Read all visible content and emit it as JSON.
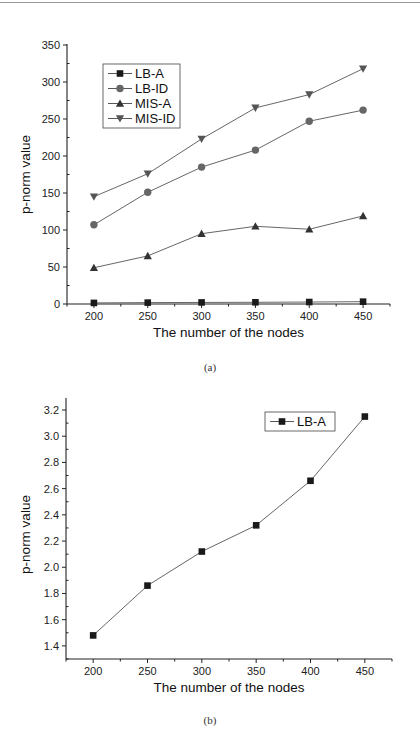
{
  "figure": {
    "captions": [
      "(a)",
      "(b)"
    ]
  },
  "chart_data": [
    {
      "type": "line",
      "panel": "(a)",
      "title": "",
      "xlabel": "The number of the nodes",
      "ylabel": "p-norm value",
      "x": [
        200,
        250,
        300,
        350,
        400,
        450
      ],
      "x_ticks": [
        "200",
        "250",
        "300",
        "350",
        "400",
        "450"
      ],
      "y_ticks": [
        "0",
        "50",
        "100",
        "150",
        "200",
        "250",
        "300",
        "350"
      ],
      "xlim": [
        175,
        475
      ],
      "ylim": [
        0,
        350
      ],
      "grid": false,
      "legend_position": "upper-left",
      "series": [
        {
          "name": "LB-A",
          "marker": "square",
          "color": "#1a1a1a",
          "values": [
            1.48,
            1.86,
            2.12,
            2.32,
            2.66,
            3.15
          ]
        },
        {
          "name": "LB-ID",
          "marker": "circle",
          "color": "#666666",
          "values": [
            107,
            151,
            185,
            208,
            247,
            262
          ]
        },
        {
          "name": "MIS-A",
          "marker": "triangle-up",
          "color": "#333333",
          "values": [
            49,
            65,
            95,
            105,
            101,
            119
          ]
        },
        {
          "name": "MIS-ID",
          "marker": "triangle-down",
          "color": "#555555",
          "values": [
            145,
            176,
            223,
            265,
            283,
            318
          ]
        }
      ]
    },
    {
      "type": "line",
      "panel": "(b)",
      "title": "",
      "xlabel": "The number of the nodes",
      "ylabel": "p-norm value",
      "x": [
        200,
        250,
        300,
        350,
        400,
        450
      ],
      "x_ticks": [
        "200",
        "250",
        "300",
        "350",
        "400",
        "450"
      ],
      "y_ticks": [
        "1.4",
        "1.6",
        "1.8",
        "2.0",
        "2.2",
        "2.4",
        "2.6",
        "2.8",
        "3.0",
        "3.2"
      ],
      "xlim": [
        175,
        475
      ],
      "ylim": [
        1.3,
        3.3
      ],
      "grid": false,
      "legend_position": "upper-right",
      "series": [
        {
          "name": "LB-A",
          "marker": "square",
          "color": "#1a1a1a",
          "values": [
            1.48,
            1.86,
            2.12,
            2.32,
            2.66,
            3.15
          ]
        }
      ]
    }
  ]
}
